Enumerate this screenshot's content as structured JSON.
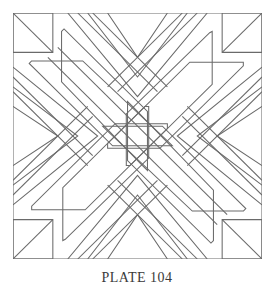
{
  "caption": "PLATE 104",
  "diagram": {
    "elements": [
      "outer-square",
      "corner-squares-with-diagonals",
      "diagonal-bands",
      "chevron-strips",
      "parallelogram-panels"
    ]
  },
  "colors": {
    "line": "#6a6a6a",
    "background": "#ffffff",
    "caption": "#3a3a3a"
  }
}
